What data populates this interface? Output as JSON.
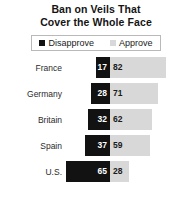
{
  "chart_data": {
    "type": "bar",
    "subtype": "diverging-stacked-bar",
    "title": "Ban on Veils That Cover the Whole Face",
    "title_lines": [
      "Ban on Veils That",
      "Cover the Whole Face"
    ],
    "xlabel": "",
    "ylabel": "",
    "categories": [
      "France",
      "Germany",
      "Britain",
      "Spain",
      "U.S."
    ],
    "series": [
      {
        "name": "Disapprove",
        "color": "#121212",
        "direction": "left",
        "values": [
          17,
          28,
          32,
          37,
          65
        ]
      },
      {
        "name": "Approve",
        "color": "#d8d8d8",
        "direction": "right",
        "values": [
          82,
          71,
          62,
          59,
          28
        ]
      }
    ],
    "rows": [
      {
        "category": "France",
        "disapprove": 17,
        "approve": 82
      },
      {
        "category": "Germany",
        "disapprove": 28,
        "approve": 71
      },
      {
        "category": "Britain",
        "disapprove": 32,
        "approve": 62
      },
      {
        "category": "Spain",
        "disapprove": 37,
        "approve": 59
      },
      {
        "category": "U.S.",
        "disapprove": 65,
        "approve": 28
      }
    ],
    "value_unit": "percent",
    "xlim": [
      0,
      100
    ],
    "grid": false,
    "legend_position": "top-center",
    "legend": [
      {
        "label": "Disapprove",
        "color": "#121212"
      },
      {
        "label": "Approve",
        "color": "#d8d8d8"
      }
    ]
  },
  "colors": {
    "disapprove": "#121212",
    "approve": "#d8d8d8",
    "background": "#ffffff",
    "text": "#1a1a1a",
    "legend_border": "#b9b9b9"
  }
}
